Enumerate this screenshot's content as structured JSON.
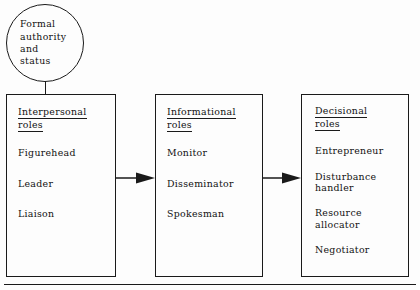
{
  "diagram": {
    "source_node": {
      "shape": "circle",
      "text": "Formal\nauthority\nand\nstatus"
    },
    "boxes": [
      {
        "id": "interpersonal",
        "heading_line1": "Interpersonal",
        "heading_line2": "roles",
        "items": [
          {
            "text": "Figurehead",
            "gap_before": false
          },
          {
            "text": "Leader",
            "gap_before": false
          },
          {
            "text": "Liaison",
            "gap_before": true
          }
        ]
      },
      {
        "id": "informational",
        "heading_line1": "Informational",
        "heading_line2": "roles",
        "items": [
          {
            "text": "Monitor",
            "gap_before": false
          },
          {
            "text": "Disseminator",
            "gap_before": false
          },
          {
            "text": "Spokesman",
            "gap_before": true
          }
        ]
      },
      {
        "id": "decisional",
        "heading_line1": "Decisional",
        "heading_line2": "roles",
        "items": [
          {
            "text": "Entrepreneur",
            "gap_before": false
          },
          {
            "text": "Disturbance\n  handler",
            "gap_before": false
          },
          {
            "text": "Resource\n  allocator",
            "gap_before": false
          },
          {
            "text": "Negotiator",
            "gap_before": false
          }
        ]
      }
    ],
    "connectors": [
      {
        "id": "stem",
        "type": "line",
        "from": "source_node",
        "to": "interpersonal"
      },
      {
        "id": "arrow-1",
        "type": "arrow",
        "from": "interpersonal",
        "to": "informational"
      },
      {
        "id": "arrow-2",
        "type": "arrow",
        "from": "informational",
        "to": "decisional"
      }
    ],
    "colors": {
      "ink": "#1a1a1a",
      "text": "#111111",
      "background": "#fdfdfd"
    }
  }
}
